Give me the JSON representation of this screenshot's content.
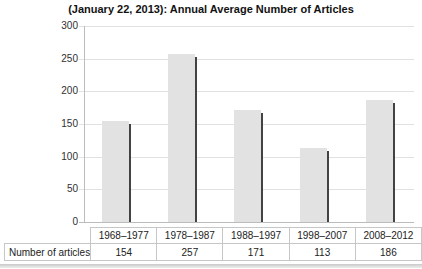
{
  "chart_data": {
    "type": "bar",
    "title": "(January 22, 2013): Annual Average Number of Articles",
    "categories": [
      "1968–1977",
      "1978–1987",
      "1988–1997",
      "1998–2007",
      "2008–2012"
    ],
    "series_name": "Number of articles",
    "values": [
      154,
      257,
      171,
      113,
      186
    ],
    "ylim": [
      0,
      300
    ],
    "yticks": [
      0,
      50,
      100,
      150,
      200,
      250,
      300
    ],
    "xlabel": "",
    "ylabel": "",
    "grid": "horizontal",
    "legend": "none",
    "bar_color": "#e2e2e2",
    "bar_shadow_color": "#434343",
    "data_table_shown": true
  }
}
